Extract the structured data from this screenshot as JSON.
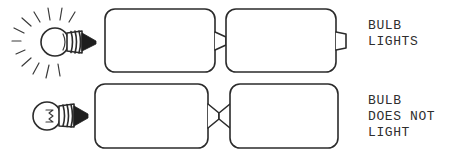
{
  "figure": {
    "background_color": "#ffffff",
    "ink_color": "#2b2b2b",
    "style": "hand-drawn line art",
    "width": 475,
    "height": 155
  },
  "rows": [
    {
      "id": "row-top",
      "caption": "BULB\nLIGHTS",
      "caption_lines": [
        "BULB",
        "LIGHTS"
      ],
      "bulb": {
        "state": "lit",
        "rays_visible": true,
        "ray_count": 11,
        "label": "lit-bulb"
      },
      "batteries": [
        {
          "index": 1,
          "terminal_side": "right",
          "label": "battery-top-left"
        },
        {
          "index": 2,
          "terminal_side": "right",
          "label": "battery-top-right"
        }
      ],
      "junction": "series-terminal-to-body",
      "circuit_result": "closed"
    },
    {
      "id": "row-bottom",
      "caption": "BULB\nDOES NOT\nLIGHT",
      "caption_lines": [
        "BULB",
        "DOES NOT",
        "LIGHT"
      ],
      "bulb": {
        "state": "unlit",
        "rays_visible": false,
        "ray_count": 0,
        "label": "unlit-bulb"
      },
      "batteries": [
        {
          "index": 1,
          "terminal_side": "right",
          "label": "battery-bottom-left"
        },
        {
          "index": 2,
          "terminal_side": "left",
          "label": "battery-bottom-right"
        }
      ],
      "junction": "opposing-terminals",
      "circuit_result": "open"
    }
  ]
}
